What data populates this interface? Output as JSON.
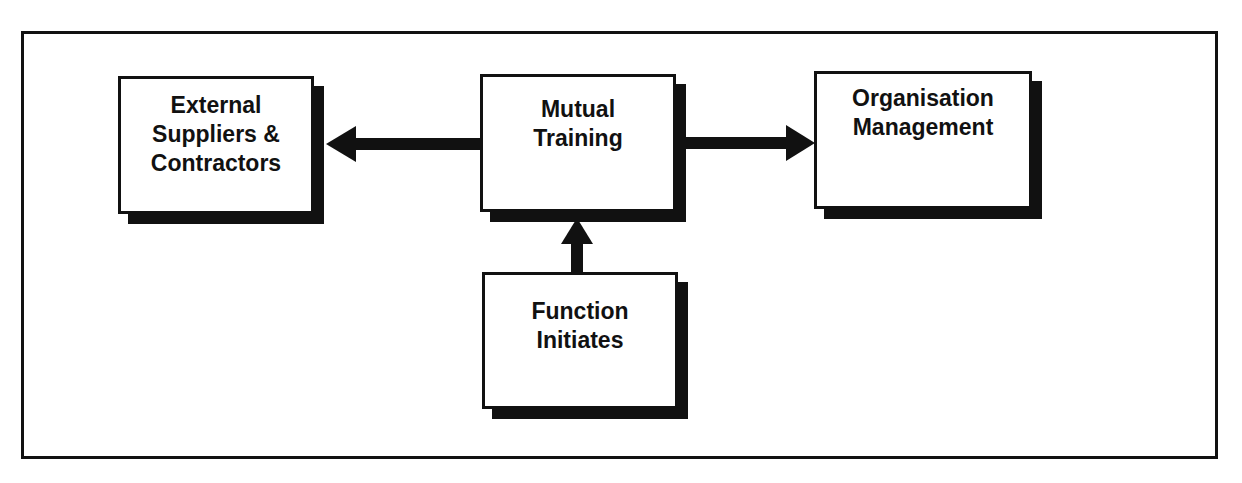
{
  "diagram": {
    "nodes": [
      {
        "id": "external",
        "label": "External\nSuppliers &\nContractors"
      },
      {
        "id": "mutual",
        "label": "Mutual\nTraining"
      },
      {
        "id": "organisation",
        "label": "Organisation\nManagement"
      },
      {
        "id": "function",
        "label": "Function\nInitiates"
      }
    ],
    "edges": [
      {
        "from": "mutual",
        "to": "external"
      },
      {
        "from": "mutual",
        "to": "organisation"
      },
      {
        "from": "function",
        "to": "mutual"
      }
    ],
    "colors": {
      "line": "#111111",
      "background": "#ffffff"
    }
  }
}
